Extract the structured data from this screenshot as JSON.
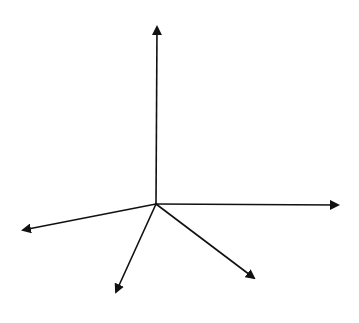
{
  "diagram": {
    "title": "",
    "stroke_color": "#111111",
    "background": "#ffffff",
    "origin": {
      "x": 156,
      "y": 204
    },
    "arrows": [
      {
        "id": "up",
        "x2": 157,
        "y2": 27
      },
      {
        "id": "right",
        "x2": 338,
        "y2": 205
      },
      {
        "id": "left",
        "x2": 23,
        "y2": 230
      },
      {
        "id": "down-left",
        "x2": 116,
        "y2": 292
      },
      {
        "id": "down-right",
        "x2": 254,
        "y2": 278
      }
    ]
  }
}
